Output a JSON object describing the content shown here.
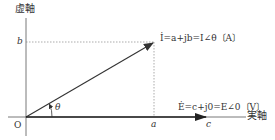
{
  "diagram": {
    "type": "phasor-diagram",
    "axes": {
      "imaginary_label": "虚軸",
      "real_label": "実軸",
      "origin_label": "O"
    },
    "ticks": {
      "b_label": "b",
      "a_label": "a",
      "c_label": "c"
    },
    "angle_label": "θ",
    "current_phasor": {
      "equation": "İ=a+jb=I∠θ〔A〕"
    },
    "voltage_phasor": {
      "equation": "Ė=c+j0=E∠0〔V〕"
    },
    "colors": {
      "line": "#333333",
      "dashed": "#888888",
      "text": "#333333"
    }
  }
}
